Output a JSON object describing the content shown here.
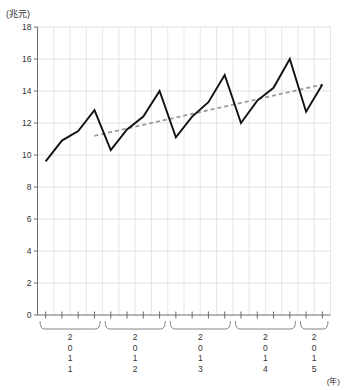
{
  "chart_data": {
    "type": "line",
    "title": "",
    "xlabel": "(年)",
    "ylabel": "(兆元)",
    "ylim": [
      0,
      18
    ],
    "ytick_step": 2,
    "ytick_labels": [
      "0",
      "2",
      "4",
      "6",
      "8",
      "10",
      "12",
      "14",
      "16",
      "18"
    ],
    "grid": true,
    "legend": "none",
    "x_group_labels": [
      "2011",
      "2012",
      "2013",
      "2014",
      "2015"
    ],
    "x_group_label_chars": [
      [
        "2",
        "0",
        "1",
        "1"
      ],
      [
        "2",
        "0",
        "1",
        "2"
      ],
      [
        "2",
        "0",
        "1",
        "3"
      ],
      [
        "2",
        "0",
        "1",
        "4"
      ],
      [
        "2",
        "0",
        "1",
        "5"
      ]
    ],
    "x_group_point_counts": [
      4,
      4,
      4,
      4,
      2
    ],
    "categories": [
      "2011Q1",
      "2011Q2",
      "2011Q3",
      "2011Q4",
      "2012Q1",
      "2012Q2",
      "2012Q3",
      "2012Q4",
      "2013Q1",
      "2013Q2",
      "2013Q3",
      "2013Q4",
      "2014Q1",
      "2014Q2",
      "2014Q3",
      "2014Q4",
      "2015Q1",
      "2015Q2"
    ],
    "series": [
      {
        "name": "quarterly-value",
        "style": "solid",
        "color": "#111111",
        "values": [
          9.6,
          10.9,
          11.5,
          12.8,
          10.3,
          11.6,
          12.4,
          14.0,
          11.1,
          12.4,
          13.3,
          15.0,
          12.0,
          13.4,
          14.2,
          16.0,
          12.7,
          14.4
        ]
      },
      {
        "name": "trend-line",
        "style": "dashed",
        "color": "#9a9a9a",
        "x_start_index": 3,
        "x_end_index": 17,
        "y_start": 11.2,
        "y_end": 14.4
      }
    ]
  },
  "axes": {
    "y_unit": "(兆元)",
    "x_unit": "(年)"
  }
}
